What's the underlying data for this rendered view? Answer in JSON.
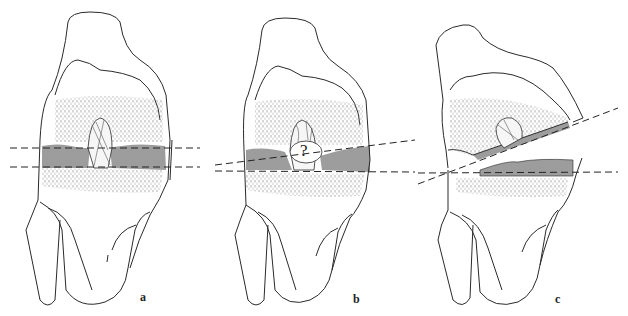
{
  "figure": {
    "colors": {
      "ink": "#2a2a2a",
      "background": "#ffffff"
    },
    "panels": [
      {
        "label": "a",
        "annotation": ""
      },
      {
        "label": "b",
        "annotation": "?"
      },
      {
        "label": "c",
        "annotation": ""
      }
    ]
  }
}
